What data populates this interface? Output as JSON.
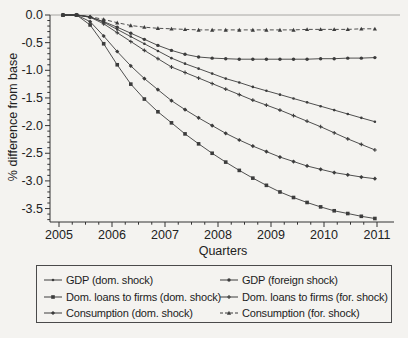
{
  "figure": {
    "xlabel": "Quarters",
    "ylabel": "% difference from base"
  },
  "chart_data": {
    "type": "line",
    "title": "",
    "xlabel": "Quarters",
    "ylabel": "% difference from base",
    "grid": false,
    "legend_position": "bottom-box",
    "xlim": [
      2004.85,
      2011.15
    ],
    "ylim": [
      -3.74,
      0.05
    ],
    "x_tick_values": [
      2005,
      2006,
      2007,
      2008,
      2009,
      2010,
      2011
    ],
    "x_tick_labels": [
      "2005",
      "2006",
      "2007",
      "2008",
      "2009",
      "2010",
      "2011"
    ],
    "y_tick_values": [
      0,
      -0.5,
      -1.0,
      -1.5,
      -2.0,
      -2.5,
      -3.0,
      -3.5
    ],
    "y_tick_labels": [
      "0.0",
      "-0.5",
      "-1.0",
      "-1.5",
      "-2.0",
      "-2.5",
      "-3.0",
      "-3.5"
    ],
    "x": [
      2005.0,
      2005.25,
      2005.5,
      2005.75,
      2006.0,
      2006.25,
      2006.5,
      2006.75,
      2007.0,
      2007.25,
      2007.5,
      2007.75,
      2008.0,
      2008.25,
      2008.5,
      2008.75,
      2009.0,
      2009.25,
      2009.5,
      2009.75,
      2010.0,
      2010.25,
      2010.5,
      2010.75
    ],
    "series": [
      {
        "name": "GDP (dom. shock)",
        "line": "solid",
        "marker": "dot",
        "values": [
          0,
          0,
          -0.03,
          -0.13,
          -0.26,
          -0.39,
          -0.52,
          -0.65,
          -0.78,
          -0.88,
          -0.97,
          -1.06,
          -1.15,
          -1.22,
          -1.3,
          -1.37,
          -1.44,
          -1.51,
          -1.58,
          -1.65,
          -1.72,
          -1.79,
          -1.86,
          -1.93
        ]
      },
      {
        "name": "Dom. loans to firms (dom. shock)",
        "line": "solid",
        "marker": "square",
        "values": [
          0,
          0,
          -0.18,
          -0.52,
          -0.9,
          -1.25,
          -1.52,
          -1.75,
          -1.95,
          -2.15,
          -2.33,
          -2.5,
          -2.66,
          -2.81,
          -2.95,
          -3.08,
          -3.2,
          -3.3,
          -3.39,
          -3.47,
          -3.54,
          -3.59,
          -3.64,
          -3.68
        ]
      },
      {
        "name": "Consumption (dom. shock)",
        "line": "solid",
        "marker": "diamond",
        "values": [
          0,
          0,
          -0.12,
          -0.38,
          -0.66,
          -0.92,
          -1.15,
          -1.35,
          -1.55,
          -1.71,
          -1.86,
          -2.0,
          -2.14,
          -2.26,
          -2.37,
          -2.47,
          -2.57,
          -2.65,
          -2.73,
          -2.79,
          -2.85,
          -2.89,
          -2.93,
          -2.96
        ]
      },
      {
        "name": "GDP (foreign shock)",
        "line": "solid",
        "marker": "circle",
        "values": [
          0,
          0,
          -0.04,
          -0.12,
          -0.22,
          -0.33,
          -0.44,
          -0.55,
          -0.64,
          -0.71,
          -0.76,
          -0.78,
          -0.79,
          -0.8,
          -0.8,
          -0.8,
          -0.8,
          -0.8,
          -0.8,
          -0.79,
          -0.79,
          -0.78,
          -0.78,
          -0.77
        ]
      },
      {
        "name": "Dom. loans to firms (for. shock)",
        "line": "solid",
        "marker": "plus",
        "values": [
          0,
          0,
          -0.04,
          -0.16,
          -0.32,
          -0.48,
          -0.64,
          -0.79,
          -0.94,
          -1.04,
          -1.14,
          -1.24,
          -1.34,
          -1.44,
          -1.54,
          -1.63,
          -1.72,
          -1.82,
          -1.92,
          -2.02,
          -2.13,
          -2.24,
          -2.34,
          -2.44
        ]
      },
      {
        "name": "Consumption (for. shock)",
        "line": "dashed",
        "marker": "triangle",
        "values": [
          0,
          0,
          -0.03,
          -0.08,
          -0.14,
          -0.19,
          -0.22,
          -0.24,
          -0.25,
          -0.26,
          -0.27,
          -0.27,
          -0.27,
          -0.27,
          -0.27,
          -0.27,
          -0.27,
          -0.27,
          -0.26,
          -0.26,
          -0.26,
          -0.26,
          -0.25,
          -0.25
        ]
      }
    ],
    "colors": {
      "line": "#3c3c3c",
      "zero_line": "#9e9e9a",
      "axis": "#333333",
      "text": "#222222",
      "background": "#f4f3f0",
      "legend_border": "#4a4a4a"
    }
  },
  "legend": {
    "columns": [
      {
        "items": [
          {
            "label": "GDP (dom. shock)"
          },
          {
            "label": "Dom. loans to firms (dom. shock)"
          },
          {
            "label": "Consumption (dom. shock)"
          }
        ]
      },
      {
        "items": [
          {
            "label": "GDP (foreign shock)"
          },
          {
            "label": "Dom. loans to firms (for. shock)"
          },
          {
            "label": "Consumption (for. shock)"
          }
        ]
      }
    ]
  }
}
